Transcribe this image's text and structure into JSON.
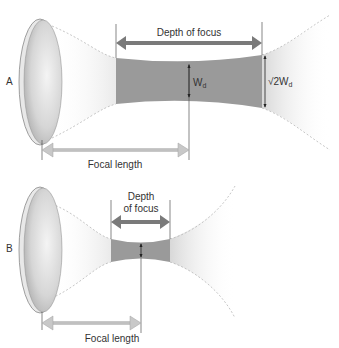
{
  "panels": [
    {
      "id": "A",
      "label": "A",
      "depth_label": "Depth of focus",
      "focal_label": "Focal length",
      "waist_label_main": "W",
      "waist_label_sub": "d",
      "edge_label_main": "√2W",
      "edge_label_sub": "d"
    },
    {
      "id": "B",
      "label": "B",
      "depth_label_line1": "Depth",
      "depth_label_line2": "of focus",
      "focal_label": "Focal length"
    }
  ],
  "colors": {
    "focus_region": "#9a9a9a",
    "depth_arrow": "#7a7a7a",
    "focal_arrow": "#c8c8c8",
    "lens_light": "#f0f0f0",
    "lens_dark": "#a8a8a8",
    "beam_edge": "#b0b0b0"
  }
}
